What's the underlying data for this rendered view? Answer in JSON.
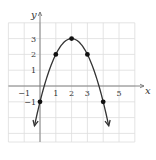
{
  "chart_data": {
    "type": "line",
    "title": "",
    "xlabel": "x",
    "ylabel": "y",
    "xlim": [
      -2,
      6
    ],
    "ylim": [
      -3.5,
      4
    ],
    "grid": true,
    "x_tick_labels": [
      "-1",
      "1",
      "2",
      "3",
      "5"
    ],
    "x_ticks": [
      -1,
      1,
      2,
      3,
      5
    ],
    "y_tick_labels": [
      "-1",
      "1",
      "2",
      "3"
    ],
    "y_ticks": [
      -1,
      1,
      2,
      3
    ],
    "series": [
      {
        "name": "parabola",
        "equation": "y = -(x-2)^2 + 3",
        "points": [
          {
            "x": 0,
            "y": -1
          },
          {
            "x": 1,
            "y": 2
          },
          {
            "x": 2,
            "y": 3
          },
          {
            "x": 3,
            "y": 2
          },
          {
            "x": 4,
            "y": -1
          }
        ],
        "arrows_at_ends": true
      }
    ],
    "colors": {
      "curve": "#333333",
      "grid": "#dddddd",
      "axis": "#777777"
    }
  }
}
